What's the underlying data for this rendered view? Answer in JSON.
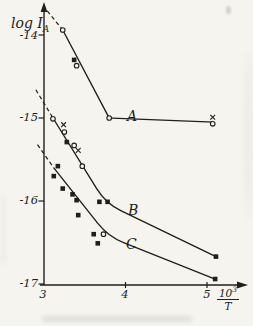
{
  "figure": {
    "ylabel": {
      "main": "log I",
      "sub": "A"
    },
    "xlabel_fraction": {
      "numerator_base": "10",
      "numerator_exp": "3",
      "denominator": "T"
    }
  },
  "style": {
    "ink": "#211f1c",
    "paper": "#f5f4ef"
  },
  "chart_data": {
    "type": "line",
    "title": "",
    "xlabel": "10^3/T",
    "ylabel": "log I_A",
    "xlim": [
      3,
      5.5
    ],
    "ylim": [
      -17.1,
      -13.6
    ],
    "grid": false,
    "legend": "labels drawn beside curves",
    "x_ticks": [
      {
        "v": 3,
        "label": "3"
      },
      {
        "v": 4,
        "label": "4"
      },
      {
        "v": 5,
        "label": "5"
      }
    ],
    "y_ticks": [
      {
        "v": -14,
        "label": "-14"
      },
      {
        "v": -15,
        "label": "-15"
      },
      {
        "v": -16,
        "label": "-16"
      },
      {
        "v": -17,
        "label": "-17"
      }
    ],
    "series": [
      {
        "name": "A",
        "label": "A",
        "bend": "sharp",
        "dashed_extrapolation": [
          [
            3.04,
            -13.71
          ],
          [
            3.23,
            -13.94
          ]
        ],
        "line": [
          [
            3.23,
            -13.94
          ],
          [
            3.8,
            -15.0
          ],
          [
            5.08,
            -15.05
          ]
        ],
        "points": [
          {
            "x": 3.23,
            "y": -13.94,
            "m": "circle"
          },
          {
            "x": 3.37,
            "y": -14.3,
            "m": "square"
          },
          {
            "x": 3.4,
            "y": -14.37,
            "m": "circle"
          },
          {
            "x": 3.8,
            "y": -15.0,
            "m": "circle"
          },
          {
            "x": 5.07,
            "y": -14.99,
            "m": "x"
          },
          {
            "x": 5.07,
            "y": -15.07,
            "m": "circle"
          }
        ]
      },
      {
        "name": "B",
        "label": "B",
        "bend": "smooth",
        "dashed_extrapolation": [
          [
            2.9,
            -14.66
          ],
          [
            3.11,
            -15.0
          ]
        ],
        "line": [
          [
            3.11,
            -15.0
          ],
          [
            3.76,
            -16.03
          ],
          [
            5.11,
            -16.67
          ]
        ],
        "points": [
          {
            "x": 3.11,
            "y": -15.01,
            "m": "circle"
          },
          {
            "x": 3.24,
            "y": -15.08,
            "m": "x"
          },
          {
            "x": 3.25,
            "y": -15.17,
            "m": "circle"
          },
          {
            "x": 3.28,
            "y": -15.29,
            "m": "square"
          },
          {
            "x": 3.37,
            "y": -15.33,
            "m": "circle"
          },
          {
            "x": 3.42,
            "y": -15.39,
            "m": "x"
          },
          {
            "x": 3.47,
            "y": -15.58,
            "m": "circle"
          },
          {
            "x": 3.68,
            "y": -16.01,
            "m": "square"
          },
          {
            "x": 3.78,
            "y": -16.01,
            "m": "square"
          },
          {
            "x": 5.11,
            "y": -16.67,
            "m": "square"
          }
        ]
      },
      {
        "name": "C",
        "label": "C",
        "bend": "smooth",
        "dashed_extrapolation": [
          [
            2.92,
            -15.32
          ],
          [
            3.12,
            -15.6
          ]
        ],
        "line": [
          [
            3.12,
            -15.6
          ],
          [
            3.79,
            -16.43
          ],
          [
            5.1,
            -16.94
          ]
        ],
        "points": [
          {
            "x": 3.17,
            "y": -15.58,
            "m": "square"
          },
          {
            "x": 3.12,
            "y": -15.7,
            "m": "square"
          },
          {
            "x": 3.23,
            "y": -15.85,
            "m": "square"
          },
          {
            "x": 3.35,
            "y": -15.92,
            "m": "square"
          },
          {
            "x": 3.4,
            "y": -15.99,
            "m": "square"
          },
          {
            "x": 3.42,
            "y": -16.17,
            "m": "square"
          },
          {
            "x": 3.61,
            "y": -16.4,
            "m": "square"
          },
          {
            "x": 3.73,
            "y": -16.4,
            "m": "circle"
          },
          {
            "x": 3.66,
            "y": -16.51,
            "m": "square"
          },
          {
            "x": 5.1,
            "y": -16.94,
            "m": "square"
          }
        ]
      }
    ]
  }
}
